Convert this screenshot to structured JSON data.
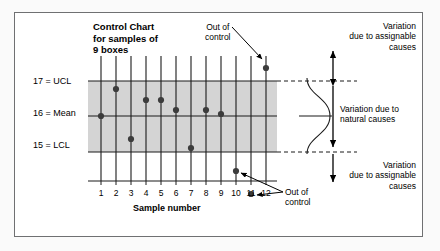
{
  "figure": {
    "kind": "control-chart-diagram",
    "background_color": "#fafafa",
    "frame_color": "#6f7072",
    "band_fill": "#d4d4d4",
    "point_color": "#3c3c3c",
    "line_color": "#1a1a1a"
  },
  "chart_title": "Control Chart\nfor samples of\n9 boxes",
  "axis": {
    "y_labels": {
      "ucl": "17 = UCL",
      "mean": "16 = Mean",
      "lcl": "15 = LCL"
    },
    "x_title": "Sample number",
    "x_ticks": [
      "1",
      "2",
      "3",
      "4",
      "5",
      "6",
      "7",
      "8",
      "9",
      "10",
      "11",
      "12"
    ]
  },
  "annotations": {
    "out_of_control_top": "Out of\ncontrol",
    "out_of_control_bottom": "Out of\ncontrol",
    "variation_assignable_top": "Variation\ndue to assignable\ncauses",
    "variation_natural": "Variation due to\nnatural causes",
    "variation_assignable_bottom": "Variation\ndue to assignable\ncauses"
  },
  "chart_data": {
    "type": "scatter",
    "title": "Control Chart for samples of 9 boxes",
    "xlabel": "Sample number",
    "ylabel": "",
    "x": [
      1,
      2,
      3,
      4,
      5,
      6,
      7,
      8,
      9,
      10,
      11,
      12
    ],
    "categories": [
      "1",
      "2",
      "3",
      "4",
      "5",
      "6",
      "7",
      "8",
      "9",
      "10",
      "11",
      "12"
    ],
    "values": [
      16.0,
      16.75,
      15.35,
      16.45,
      16.45,
      16.15,
      15.1,
      16.15,
      16.05,
      14.45,
      13.8,
      17.45
    ],
    "ylim": [
      13.3,
      17.8
    ],
    "xlim": [
      0.4,
      12.6
    ],
    "grid": true,
    "legend": false,
    "control_limits": {
      "ucl": 17,
      "mean": 16,
      "lcl": 15
    },
    "in_control_band": [
      15,
      17
    ],
    "out_of_control_points": [
      {
        "sample": 10,
        "value": 14.45
      },
      {
        "sample": 11,
        "value": 13.8
      },
      {
        "sample": 12,
        "value": 17.45
      }
    ]
  }
}
